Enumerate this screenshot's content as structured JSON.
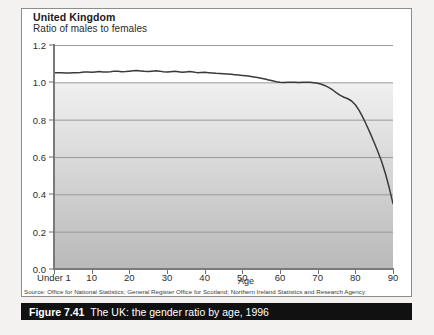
{
  "figure": {
    "caption_label": "Figure 7.41",
    "caption_title": "The UK: the gender ratio by age, 1996",
    "source": "Source: Office for National Statistics; General Register Office for Scotland; Northern Ireland Statistics and Research Agency"
  },
  "colors": {
    "line": "#3b3b3b",
    "axis": "#7a7a7a",
    "gridline": "#9a9a9a",
    "caption_bar": "#111111",
    "caption_text": "#ffffff",
    "plot_top": "#ffffff",
    "plot_bottom": "#b9b9b9"
  },
  "chart_data": {
    "type": "line",
    "title": "United Kingdom",
    "subtitle": "Ratio of males to females",
    "xlabel": "Age",
    "ylabel": "",
    "xlim": [
      0,
      90
    ],
    "ylim": [
      0.0,
      1.2
    ],
    "grid": true,
    "legend": "none",
    "y_ticks": [
      "0.0",
      "0.2",
      "0.4",
      "0.6",
      "0.8",
      "1.0",
      "1.2"
    ],
    "y_tick_values": [
      0.0,
      0.2,
      0.4,
      0.6,
      0.8,
      1.0,
      1.2
    ],
    "x_ticks": [
      "Under 1",
      "10",
      "20",
      "30",
      "40",
      "50",
      "60",
      "70",
      "80",
      "90"
    ],
    "x_tick_values": [
      0,
      10,
      20,
      30,
      40,
      50,
      60,
      70,
      80,
      90
    ],
    "series": [
      {
        "name": "Ratio of males to females",
        "x": [
          0,
          1,
          2,
          3,
          4,
          5,
          6,
          7,
          8,
          9,
          10,
          11,
          12,
          13,
          14,
          15,
          16,
          17,
          18,
          19,
          20,
          21,
          22,
          23,
          24,
          25,
          26,
          27,
          28,
          29,
          30,
          31,
          32,
          33,
          34,
          35,
          36,
          37,
          38,
          39,
          40,
          41,
          42,
          43,
          44,
          45,
          46,
          47,
          48,
          49,
          50,
          51,
          52,
          53,
          54,
          55,
          56,
          57,
          58,
          59,
          60,
          61,
          62,
          63,
          64,
          65,
          66,
          67,
          68,
          69,
          70,
          71,
          72,
          73,
          74,
          75,
          76,
          77,
          78,
          79,
          80,
          81,
          82,
          83,
          84,
          85,
          86,
          87,
          88,
          89,
          90
        ],
        "values": [
          1.052,
          1.052,
          1.051,
          1.05,
          1.05,
          1.051,
          1.052,
          1.053,
          1.055,
          1.055,
          1.054,
          1.056,
          1.058,
          1.056,
          1.055,
          1.057,
          1.06,
          1.059,
          1.057,
          1.058,
          1.06,
          1.062,
          1.063,
          1.061,
          1.059,
          1.058,
          1.06,
          1.062,
          1.06,
          1.057,
          1.055,
          1.057,
          1.059,
          1.057,
          1.054,
          1.056,
          1.058,
          1.055,
          1.052,
          1.053,
          1.054,
          1.052,
          1.05,
          1.048,
          1.047,
          1.046,
          1.045,
          1.043,
          1.041,
          1.039,
          1.037,
          1.035,
          1.032,
          1.029,
          1.026,
          1.022,
          1.018,
          1.013,
          1.008,
          1.003,
          1.0,
          0.999,
          1.0,
          1.001,
          1.0,
          0.999,
          1.0,
          1.001,
          1.0,
          0.998,
          0.995,
          0.99,
          0.982,
          0.972,
          0.959,
          0.944,
          0.93,
          0.92,
          0.912,
          0.9,
          0.88,
          0.85,
          0.812,
          0.77,
          0.725,
          0.678,
          0.628,
          0.575,
          0.51,
          0.435,
          0.35
        ]
      }
    ]
  }
}
